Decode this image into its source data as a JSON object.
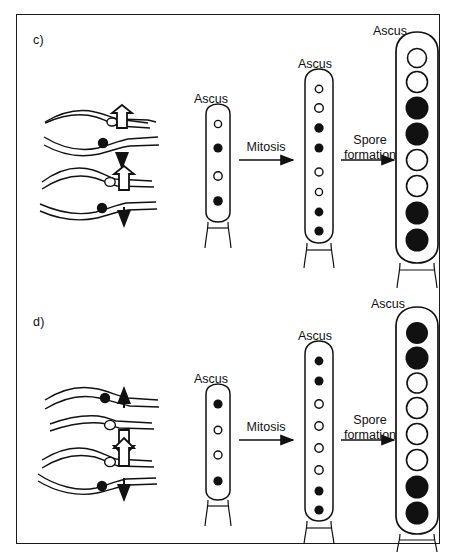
{
  "figure": {
    "border_color": "#1a1a1a",
    "background": "#ffffff",
    "ink_color": "#111111",
    "spore_filled_color": "#000000",
    "spore_open_color": "#ffffff"
  },
  "panels": [
    {
      "id": "c",
      "label": "c)",
      "chromosome_diagram": {
        "name": "chromosome-segregation-diagram-c",
        "bivalents": [
          {
            "index": 0,
            "upper_centromere": "open",
            "lower_centromere": "filled",
            "arrow_up_style": "outline",
            "arrow_down_style": "solid"
          },
          {
            "index": 1,
            "upper_centromere": "open",
            "lower_centromere": "filled",
            "arrow_up_style": "outline",
            "arrow_down_style": "solid"
          }
        ]
      },
      "stages": [
        {
          "name": "ascus-stage-1",
          "label": "Ascus",
          "nuclei_count": 4,
          "spore_size": "small",
          "nuclei": [
            "open",
            "filled",
            "open",
            "filled"
          ]
        },
        {
          "name": "ascus-stage-2",
          "label": "Ascus",
          "nuclei_count": 8,
          "spore_size": "small",
          "nuclei": [
            "open",
            "open",
            "filled",
            "filled",
            "open",
            "open",
            "filled",
            "filled"
          ]
        },
        {
          "name": "ascus-stage-3",
          "label": "Ascus",
          "nuclei_count": 8,
          "spore_size": "large",
          "nuclei": [
            "open",
            "open",
            "filled",
            "filled",
            "open",
            "open",
            "filled",
            "filled"
          ]
        }
      ],
      "transitions": [
        {
          "name": "mitosis-arrow-c",
          "label": "Mitosis"
        },
        {
          "name": "spore-formation-arrow-c",
          "label_line1": "Spore",
          "label_line2": "formation"
        }
      ]
    },
    {
      "id": "d",
      "label": "d)",
      "chromosome_diagram": {
        "name": "chromosome-segregation-diagram-d",
        "bivalents": [
          {
            "index": 0,
            "upper_centromere": "filled",
            "lower_centromere": "open",
            "arrow_up_style": "solid",
            "arrow_down_style": "outline"
          },
          {
            "index": 1,
            "upper_centromere": "open",
            "lower_centromere": "filled",
            "arrow_up_style": "outline",
            "arrow_down_style": "solid"
          }
        ]
      },
      "stages": [
        {
          "name": "ascus-stage-1",
          "label": "Ascus",
          "nuclei_count": 4,
          "spore_size": "small",
          "nuclei": [
            "filled",
            "open",
            "open",
            "filled"
          ]
        },
        {
          "name": "ascus-stage-2",
          "label": "Ascus",
          "nuclei_count": 8,
          "spore_size": "small",
          "nuclei": [
            "filled",
            "filled",
            "open",
            "open",
            "open",
            "open",
            "filled",
            "filled"
          ]
        },
        {
          "name": "ascus-stage-3",
          "label": "Ascus",
          "nuclei_count": 8,
          "spore_size": "large",
          "nuclei": [
            "filled",
            "filled",
            "open",
            "open",
            "open",
            "open",
            "filled",
            "filled"
          ]
        }
      ],
      "transitions": [
        {
          "name": "mitosis-arrow-d",
          "label": "Mitosis"
        },
        {
          "name": "spore-formation-arrow-d",
          "label_line1": "Spore",
          "label_line2": "formation"
        }
      ]
    }
  ]
}
